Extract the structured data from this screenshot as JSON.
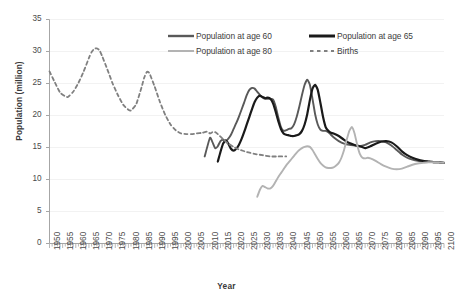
{
  "top_clipped_text": "",
  "chart_data": {
    "type": "line",
    "title": "",
    "xlabel": "Year",
    "ylabel": "Population (million)",
    "xlim": [
      1950,
      2100
    ],
    "ylim": [
      0,
      35
    ],
    "ytick_step": 5,
    "xtick_step": 5,
    "grid": true,
    "legend_position": "top-center",
    "ytick_labels": [
      "0",
      "5",
      "10",
      "15",
      "20",
      "25",
      "30",
      "35"
    ],
    "ytick_values": [
      0,
      5,
      10,
      15,
      20,
      25,
      30,
      35
    ],
    "xtick_labels": [
      "1950",
      "1955",
      "1960",
      "1965",
      "1970",
      "1975",
      "1980",
      "1985",
      "1990",
      "1995",
      "2000",
      "2005",
      "2010",
      "2015",
      "2020",
      "2025",
      "2030",
      "2035",
      "2040",
      "2045",
      "2050",
      "2055",
      "2060",
      "2065",
      "2070",
      "2075",
      "2080",
      "2085",
      "2090",
      "2095",
      "2100"
    ],
    "colors": {
      "age60": "#595959",
      "age65": "#1a1a1a",
      "age80": "#b3b3b3",
      "births": "#808080",
      "grid": "#f2f2f2",
      "axis": "#a6a6a6"
    },
    "series": [
      {
        "name": "Population at age 60",
        "style": "solid",
        "color": "#595959",
        "width": 1.9,
        "x": [
          2009,
          2011,
          2012,
          2013,
          2014,
          2015,
          2016,
          2017,
          2018,
          2019,
          2020,
          2021,
          2022,
          2023,
          2024,
          2025,
          2026,
          2027,
          2028,
          2029,
          2030,
          2031,
          2032,
          2033,
          2034,
          2035,
          2036,
          2037,
          2038,
          2039,
          2040,
          2041,
          2042,
          2043,
          2044,
          2045,
          2046,
          2047,
          2048,
          2049,
          2050,
          2051,
          2052,
          2053,
          2054,
          2055,
          2056,
          2057,
          2058,
          2060,
          2062,
          2064,
          2066,
          2068,
          2070,
          2072,
          2074,
          2076,
          2078,
          2080,
          2082,
          2084,
          2086,
          2088,
          2090,
          2092,
          2094,
          2096,
          2098,
          2100
        ],
        "y": [
          13.6,
          16.5,
          15.8,
          14.9,
          15.2,
          16.0,
          16.2,
          16.0,
          16.4,
          17.0,
          17.9,
          18.8,
          19.8,
          20.9,
          22.0,
          23.2,
          24.0,
          24.3,
          24.2,
          23.7,
          23.2,
          22.8,
          22.6,
          22.6,
          22.6,
          22.5,
          21.4,
          19.7,
          18.2,
          17.6,
          17.7,
          17.9,
          18.0,
          18.6,
          19.8,
          21.4,
          23.2,
          24.8,
          25.6,
          24.8,
          22.6,
          20.2,
          18.6,
          17.8,
          17.6,
          17.6,
          17.4,
          17.0,
          16.6,
          16.0,
          15.6,
          15.4,
          15.3,
          15.2,
          15.4,
          15.8,
          16.0,
          16.0,
          15.8,
          15.3,
          14.6,
          13.9,
          13.4,
          13.1,
          12.9,
          12.8,
          12.8,
          12.7,
          12.7,
          12.6
        ]
      },
      {
        "name": "Population at age 65",
        "style": "solid",
        "color": "#1a1a1a",
        "width": 2.2,
        "x": [
          2014,
          2015,
          2016,
          2017,
          2018,
          2019,
          2020,
          2021,
          2022,
          2023,
          2024,
          2025,
          2026,
          2027,
          2028,
          2029,
          2030,
          2031,
          2032,
          2033,
          2034,
          2035,
          2036,
          2037,
          2038,
          2039,
          2040,
          2041,
          2042,
          2043,
          2044,
          2045,
          2046,
          2047,
          2048,
          2049,
          2050,
          2051,
          2052,
          2053,
          2054,
          2055,
          2056,
          2057,
          2058,
          2060,
          2062,
          2064,
          2066,
          2068,
          2070,
          2072,
          2074,
          2076,
          2078,
          2080,
          2082,
          2084,
          2086,
          2088,
          2090,
          2092,
          2094,
          2096,
          2098,
          2100
        ],
        "y": [
          12.8,
          14.3,
          15.6,
          16.1,
          15.6,
          14.8,
          14.5,
          14.8,
          15.4,
          16.3,
          17.4,
          18.6,
          19.8,
          21.0,
          22.1,
          22.8,
          23.1,
          22.9,
          22.7,
          22.8,
          22.6,
          21.9,
          20.6,
          19.1,
          17.9,
          17.2,
          17.0,
          16.9,
          16.8,
          16.8,
          16.9,
          17.1,
          17.6,
          18.6,
          20.2,
          22.4,
          24.2,
          24.8,
          24.0,
          22.0,
          19.8,
          18.2,
          17.6,
          17.3,
          17.2,
          16.8,
          16.2,
          15.7,
          15.4,
          15.2,
          14.9,
          15.2,
          15.6,
          15.9,
          16.0,
          15.8,
          15.2,
          14.4,
          13.8,
          13.4,
          13.1,
          12.9,
          12.8,
          12.7,
          12.7,
          12.6
        ]
      },
      {
        "name": "Population at age 80",
        "style": "solid",
        "color": "#b3b3b3",
        "width": 1.9,
        "x": [
          2029,
          2030,
          2031,
          2032,
          2033,
          2034,
          2035,
          2036,
          2037,
          2038,
          2039,
          2040,
          2041,
          2042,
          2043,
          2044,
          2045,
          2046,
          2047,
          2048,
          2049,
          2050,
          2051,
          2052,
          2053,
          2054,
          2055,
          2056,
          2057,
          2058,
          2059,
          2060,
          2061,
          2062,
          2063,
          2064,
          2065,
          2066,
          2067,
          2068,
          2069,
          2070,
          2071,
          2072,
          2074,
          2076,
          2078,
          2080,
          2082,
          2084,
          2086,
          2088,
          2090,
          2092,
          2094,
          2096,
          2098,
          2100
        ],
        "y": [
          7.3,
          8.4,
          9.0,
          8.8,
          8.6,
          8.6,
          9.0,
          9.7,
          10.4,
          11.0,
          11.6,
          12.2,
          12.7,
          13.2,
          13.7,
          14.2,
          14.6,
          14.9,
          15.1,
          15.2,
          15.1,
          14.6,
          13.9,
          13.2,
          12.6,
          12.2,
          11.9,
          11.8,
          11.8,
          11.9,
          12.2,
          12.6,
          13.4,
          14.6,
          16.2,
          17.6,
          18.2,
          17.2,
          15.4,
          14.0,
          13.4,
          13.3,
          13.4,
          13.3,
          12.9,
          12.4,
          12.0,
          11.7,
          11.6,
          11.7,
          12.0,
          12.3,
          12.5,
          12.6,
          12.7,
          12.7,
          12.7,
          12.6
        ]
      },
      {
        "name": "Births",
        "style": "dashed",
        "color": "#808080",
        "width": 1.8,
        "x": [
          1950,
          1952,
          1954,
          1956,
          1957,
          1959,
          1961,
          1963,
          1965,
          1966,
          1967,
          1968,
          1969,
          1970,
          1972,
          1974,
          1976,
          1978,
          1980,
          1981,
          1983,
          1985,
          1986,
          1987,
          1988,
          1990,
          1992,
          1994,
          1996,
          1998,
          2000,
          2002,
          2004,
          2006,
          2008,
          2010,
          2011,
          2012,
          2013,
          2014,
          2016,
          2018,
          2020,
          2022,
          2025,
          2028,
          2031,
          2034,
          2037,
          2040
        ],
        "y": [
          26.9,
          25.2,
          23.6,
          23.0,
          22.9,
          23.7,
          25.1,
          26.9,
          29.0,
          29.9,
          30.4,
          30.5,
          30.2,
          29.3,
          27.2,
          25.0,
          23.2,
          21.7,
          20.9,
          20.8,
          21.8,
          24.4,
          25.9,
          26.8,
          26.6,
          24.5,
          22.1,
          20.1,
          18.6,
          17.7,
          17.2,
          17.1,
          17.1,
          17.2,
          17.3,
          17.5,
          17.2,
          17.4,
          17.4,
          17.1,
          16.3,
          15.6,
          15.1,
          14.7,
          14.3,
          14.0,
          13.8,
          13.6,
          13.6,
          13.6
        ]
      }
    ]
  },
  "legend": {
    "items": [
      {
        "label": "Population at age 60",
        "color": "#595959",
        "style": "solid",
        "thickness": 2.4
      },
      {
        "label": "Population at age 65",
        "color": "#1a1a1a",
        "style": "solid",
        "thickness": 3.0
      },
      {
        "label": "Population at age 80",
        "color": "#b3b3b3",
        "style": "solid",
        "thickness": 2.0
      },
      {
        "label": "Births",
        "color": "#808080",
        "style": "dashed",
        "thickness": 1.8
      }
    ]
  }
}
